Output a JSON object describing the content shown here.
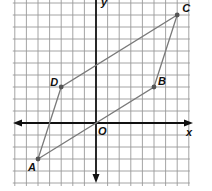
{
  "diagram": {
    "type": "coordinate-plane-parallelogram",
    "axes": {
      "x_label": "x",
      "y_label": "y",
      "origin_label": "O",
      "x_range": [
        -7,
        8
      ],
      "y_range": [
        -5,
        10
      ]
    },
    "vertices": [
      {
        "label": "A",
        "x": -5,
        "y": -3
      },
      {
        "label": "B",
        "x": 5,
        "y": 3
      },
      {
        "label": "C",
        "x": 7,
        "y": 9
      },
      {
        "label": "D",
        "x": -3,
        "y": 3
      }
    ],
    "colors": {
      "grid": "#9a9a9a",
      "axis": "#111111",
      "shape": "#7a7a7a",
      "point": "#555555"
    }
  }
}
